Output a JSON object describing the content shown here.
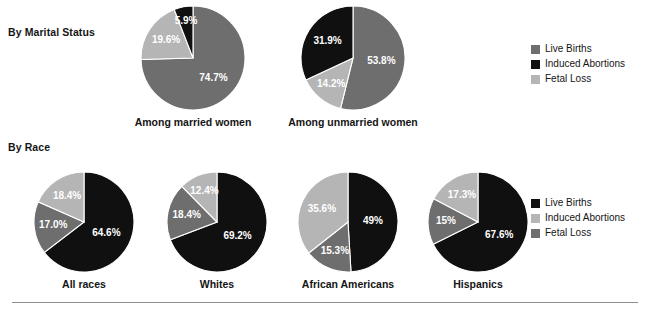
{
  "sections": {
    "marital": {
      "label": "By Marital Status"
    },
    "race": {
      "label": "By Race"
    }
  },
  "colors": {
    "live_births_top": "#6e6e6e",
    "induced_abortions_top": "#101010",
    "fetal_loss_top": "#b5b5b5",
    "live_births_bottom": "#101010",
    "induced_abortions_bottom": "#b5b5b5",
    "fetal_loss_bottom": "#6e6e6e",
    "background": "#ffffff",
    "text": "#151515",
    "rule": "#8e8e8e"
  },
  "legends": {
    "top": {
      "items": [
        {
          "label": "Live Births",
          "color": "#6e6e6e"
        },
        {
          "label": "Induced Abortions",
          "color": "#101010"
        },
        {
          "label": "Fetal Loss",
          "color": "#b5b5b5"
        }
      ]
    },
    "bottom": {
      "items": [
        {
          "label": "Live Births",
          "color": "#101010"
        },
        {
          "label": "Induced Abortions",
          "color": "#b5b5b5"
        },
        {
          "label": "Fetal Loss",
          "color": "#6e6e6e"
        }
      ]
    }
  },
  "chart_data": {
    "type": "pie",
    "title": "",
    "charts": [
      {
        "id": "married",
        "group": "By Marital Status",
        "caption": "Among married women",
        "slices": [
          {
            "name": "Live Births",
            "value": 74.7,
            "label": "74.7%",
            "color": "#6e6e6e"
          },
          {
            "name": "Fetal Loss",
            "value": 19.6,
            "label": "19.6%",
            "color": "#b5b5b5"
          },
          {
            "name": "Induced Abortions",
            "value": 5.9,
            "label": "5.9%",
            "color": "#101010"
          }
        ]
      },
      {
        "id": "unmarried",
        "group": "By Marital Status",
        "caption": "Among unmarried women",
        "slices": [
          {
            "name": "Live Births",
            "value": 53.8,
            "label": "53.8%",
            "color": "#6e6e6e"
          },
          {
            "name": "Fetal Loss",
            "value": 14.2,
            "label": "14.2%",
            "color": "#b5b5b5"
          },
          {
            "name": "Induced Abortions",
            "value": 31.9,
            "label": "31.9%",
            "color": "#101010"
          }
        ]
      },
      {
        "id": "all-races",
        "group": "By Race",
        "caption": "All races",
        "slices": [
          {
            "name": "Live Births",
            "value": 64.6,
            "label": "64.6%",
            "color": "#101010"
          },
          {
            "name": "Fetal Loss",
            "value": 17.0,
            "label": "17.0%",
            "color": "#6e6e6e"
          },
          {
            "name": "Induced Abortions",
            "value": 18.4,
            "label": "18.4%",
            "color": "#b5b5b5"
          }
        ]
      },
      {
        "id": "whites",
        "group": "By Race",
        "caption": "Whites",
        "slices": [
          {
            "name": "Live Births",
            "value": 69.2,
            "label": "69.2%",
            "color": "#101010"
          },
          {
            "name": "Fetal Loss",
            "value": 18.4,
            "label": "18.4%",
            "color": "#6e6e6e"
          },
          {
            "name": "Induced Abortions",
            "value": 12.4,
            "label": "12.4%",
            "color": "#b5b5b5"
          }
        ]
      },
      {
        "id": "african-americans",
        "group": "By Race",
        "caption": "African Americans",
        "slices": [
          {
            "name": "Live Births",
            "value": 49.0,
            "label": "49%",
            "color": "#101010"
          },
          {
            "name": "Fetal Loss",
            "value": 15.3,
            "label": "15.3%",
            "color": "#6e6e6e"
          },
          {
            "name": "Induced Abortions",
            "value": 35.6,
            "label": "35.6%",
            "color": "#b5b5b5"
          }
        ]
      },
      {
        "id": "hispanics",
        "group": "By Race",
        "caption": "Hispanics",
        "slices": [
          {
            "name": "Live Births",
            "value": 67.6,
            "label": "67.6%",
            "color": "#101010"
          },
          {
            "name": "Fetal Loss",
            "value": 15.0,
            "label": "15%",
            "color": "#6e6e6e"
          },
          {
            "name": "Induced Abortions",
            "value": 17.3,
            "label": "17.3%",
            "color": "#b5b5b5"
          }
        ]
      }
    ]
  }
}
